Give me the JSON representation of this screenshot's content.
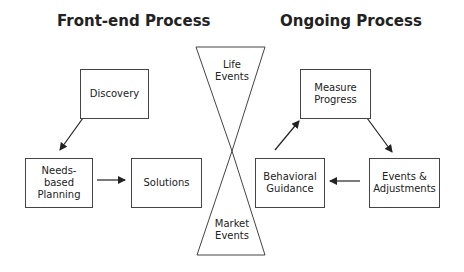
{
  "sections": {
    "front_end": {
      "title": "Front-end Process"
    },
    "ongoing": {
      "title": "Ongoing Process"
    }
  },
  "nodes": {
    "discovery": {
      "label": "Discovery"
    },
    "needs_based_planning": {
      "label": "Needs-\nbased\nPlanning"
    },
    "solutions": {
      "label": "Solutions"
    },
    "measure_progress": {
      "label": "Measure\nProgress"
    },
    "events_adjustments": {
      "label": "Events &\nAdjustments"
    },
    "behavioral_guidance": {
      "label": "Behavioral\nGuidance"
    }
  },
  "hourglass": {
    "top_label": "Life\nEvents",
    "bottom_label": "Market\nEvents"
  },
  "edges": [
    {
      "from": "Discovery",
      "to": "Needs-based Planning"
    },
    {
      "from": "Needs-based Planning",
      "to": "Solutions"
    },
    {
      "from": "Behavioral Guidance",
      "to": "Measure Progress"
    },
    {
      "from": "Measure Progress",
      "to": "Events & Adjustments"
    },
    {
      "from": "Events & Adjustments",
      "to": "Behavioral Guidance"
    }
  ],
  "colors": {
    "stroke": "#444444",
    "text": "#222222",
    "background": "#ffffff"
  }
}
